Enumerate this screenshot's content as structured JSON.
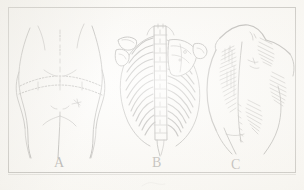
{
  "figure": {
    "background_color": "#fbfaf7",
    "ink_color": "#2e2c29",
    "frame": {
      "border_color": "#6c6a64",
      "style": "thin rectangular rule border"
    },
    "panel_count": 3
  },
  "panels": [
    {
      "id": "panel-a",
      "label": "A",
      "subject": "posterior-lower-back-and-buttocks",
      "description": "Rear view of the lower torso and buttocks drawn in light outline, with a dashed curved line marked across the iliac crest / waist level and small surface landmark marks",
      "marking_style": "dashed-line"
    },
    {
      "id": "panel-b",
      "label": "B",
      "subject": "posterior-rib-cage-and-vertebral-column",
      "description": "Skeletal drawing of the thoracic rib cage seen from behind with the vertebral column running down the midline, scapula at upper right and hatched rib shading",
      "marking_style": "hatched-bone"
    },
    {
      "id": "panel-c",
      "label": "C",
      "subject": "shaded-back-and-flank",
      "description": "Rear three-quarter view of a torso with cross-hatched shading over the paravertebral muscles, flank and shoulder",
      "marking_style": "cross-hatch-shading"
    }
  ],
  "labels": {
    "a": "A",
    "b": "B",
    "c": "C"
  },
  "icons": {
    "dashed_incision": "dashed-incision-icon",
    "hatch_shading": "hatch-shading-icon"
  }
}
